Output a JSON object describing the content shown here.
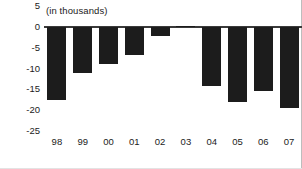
{
  "chart_data": {
    "type": "bar",
    "title": "",
    "subtitle": "",
    "unit_note": "(in thousands)",
    "xlabel": "",
    "ylabel": "",
    "categories": [
      "98",
      "99",
      "00",
      "01",
      "02",
      "03",
      "04",
      "05",
      "06",
      "07"
    ],
    "values": [
      -17.5,
      -11.2,
      -9.0,
      -6.8,
      -2.2,
      0.3,
      -14.2,
      -18.0,
      -15.5,
      -19.5
    ],
    "series": [
      {
        "name": "",
        "values": [
          -17.5,
          -11.2,
          -9.0,
          -6.8,
          -2.2,
          0.3,
          -14.2,
          -18.0,
          -15.5,
          -19.5
        ]
      }
    ],
    "ylim": [
      -25,
      5
    ],
    "yticks": [
      5,
      0,
      -5,
      -10,
      -15,
      -20,
      -25
    ],
    "ytick_labels": [
      "5",
      "0",
      "-5",
      "-10",
      "-15",
      "-20",
      "-25"
    ],
    "grid": false,
    "legend": false,
    "legend_position": "none",
    "bar_color": "#1c1c1c",
    "axis_color": "#3a3a3a",
    "text_color": "#1b1b1b",
    "frame_rule_color": "#bdbdbd"
  }
}
